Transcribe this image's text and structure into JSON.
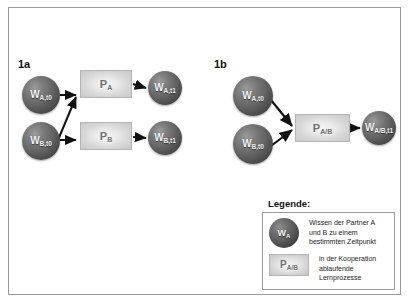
{
  "figure": {
    "background_color": "#ffffff",
    "frame_color": "#9a9a9a"
  },
  "panels": [
    {
      "id": "1a",
      "label": "1a",
      "nodes": [
        {
          "name": "w-a-t0",
          "base": "W",
          "sub": "A,t0",
          "x": 22,
          "y": 76,
          "size": 38
        },
        {
          "name": "w-b-t0",
          "base": "W",
          "sub": "B,t0",
          "x": 22,
          "y": 122,
          "size": 38
        },
        {
          "name": "w-a-t1",
          "base": "W",
          "sub": "A,t1",
          "x": 148,
          "y": 76,
          "size": 34
        },
        {
          "name": "w-b-t1",
          "base": "W",
          "sub": "B,t1",
          "x": 148,
          "y": 124,
          "size": 34
        }
      ],
      "processes": [
        {
          "name": "p-a",
          "base": "P",
          "sub": "A",
          "x": 80,
          "y": 70,
          "w": 52,
          "h": 28
        },
        {
          "name": "p-b",
          "base": "P",
          "sub": "B",
          "x": 80,
          "y": 122,
          "w": 52,
          "h": 28
        }
      ]
    },
    {
      "id": "1b",
      "label": "1b",
      "nodes": [
        {
          "name": "w-a-t0",
          "base": "W",
          "sub": "A,t0",
          "x": 233,
          "y": 76,
          "size": 40
        },
        {
          "name": "w-b-t0",
          "base": "W",
          "sub": "B,t0",
          "x": 233,
          "y": 122,
          "size": 40
        },
        {
          "name": "w-ab-t1",
          "base": "W",
          "sub": "A/B,t1",
          "x": 362,
          "y": 111,
          "size": 34
        }
      ],
      "processes": [
        {
          "name": "p-ab",
          "base": "P",
          "sub": "A/B",
          "x": 295,
          "y": 114,
          "w": 55,
          "h": 28
        }
      ]
    }
  ],
  "legend": {
    "title": "Legende:",
    "entries": [
      {
        "icon": "knowledge-sphere-icon",
        "icon_base": "W",
        "icon_sub": "A",
        "text": "Wissen der Partner A\nund B zu einem\nbestimmten Zeitpunkt"
      },
      {
        "icon": "process-box-icon",
        "icon_base": "P",
        "icon_sub": "A/B",
        "text": "in der Kooperation\nablaufende\nLernprozesse"
      }
    ]
  },
  "colors": {
    "node_dark": "#4a4a4a",
    "process_light": "#e0e0e0",
    "arrow": "#111111",
    "frame": "#9a9a9a",
    "text": "#1a1a1a"
  }
}
